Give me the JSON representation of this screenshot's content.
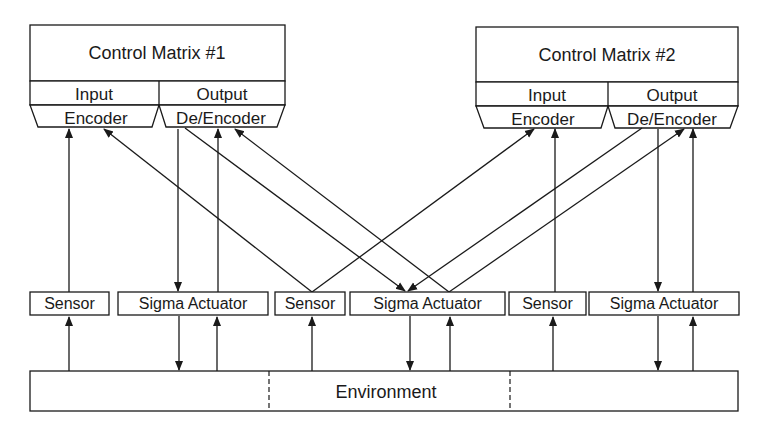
{
  "diagram": {
    "type": "block-diagram",
    "control_matrices": [
      {
        "title": "Control Matrix #1",
        "input_label": "Input",
        "input_encoder": "Encoder",
        "output_label": "Output",
        "output_encoder": "De/Encoder"
      },
      {
        "title": "Control Matrix #2",
        "input_label": "Input",
        "input_encoder": "Encoder",
        "output_label": "Output",
        "output_encoder": "De/Encoder"
      }
    ],
    "nodes": [
      {
        "id": "sensor-1",
        "label": "Sensor"
      },
      {
        "id": "sigma-actuator-1",
        "label": "Sigma Actuator"
      },
      {
        "id": "sensor-2",
        "label": "Sensor"
      },
      {
        "id": "sigma-actuator-2",
        "label": "Sigma Actuator"
      },
      {
        "id": "sensor-3",
        "label": "Sensor"
      },
      {
        "id": "sigma-actuator-3",
        "label": "Sigma Actuator"
      }
    ],
    "environment": {
      "label": "Environment",
      "segments": 3
    },
    "edges": [
      {
        "from": "sensor-1",
        "to": "cm1-input-encoder"
      },
      {
        "from": "cm1-output-deencoder",
        "to": "sigma-actuator-1"
      },
      {
        "from": "sigma-actuator-1",
        "to": "cm1-output-deencoder"
      },
      {
        "from": "sensor-2",
        "to": "cm1-input-encoder"
      },
      {
        "from": "sensor-2",
        "to": "cm2-input-encoder"
      },
      {
        "from": "cm1-output-deencoder",
        "to": "sigma-actuator-2"
      },
      {
        "from": "sigma-actuator-2",
        "to": "cm1-output-deencoder"
      },
      {
        "from": "cm2-output-deencoder",
        "to": "sigma-actuator-2"
      },
      {
        "from": "sigma-actuator-2",
        "to": "cm2-output-deencoder"
      },
      {
        "from": "sensor-3",
        "to": "cm2-input-encoder"
      },
      {
        "from": "cm2-output-deencoder",
        "to": "sigma-actuator-3"
      },
      {
        "from": "sigma-actuator-3",
        "to": "cm2-output-deencoder"
      },
      {
        "from": "environment",
        "to": "sensor-1"
      },
      {
        "from": "sigma-actuator-1",
        "to": "environment"
      },
      {
        "from": "environment",
        "to": "sigma-actuator-1"
      },
      {
        "from": "environment",
        "to": "sensor-2"
      },
      {
        "from": "sigma-actuator-2",
        "to": "environment"
      },
      {
        "from": "environment",
        "to": "sigma-actuator-2"
      },
      {
        "from": "environment",
        "to": "sensor-3"
      },
      {
        "from": "sigma-actuator-3",
        "to": "environment"
      },
      {
        "from": "environment",
        "to": "sigma-actuator-3"
      }
    ]
  }
}
